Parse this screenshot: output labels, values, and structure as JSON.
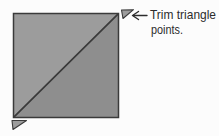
{
  "figure": {
    "kind": "quilt-block-diagram",
    "annotation": {
      "line1": "Trim triangle",
      "line2": "points."
    },
    "icons": {
      "arrow": "left-arrow"
    },
    "shapes": {
      "unit": "half-square-triangle",
      "dog_ears": [
        "top-right",
        "bottom-left"
      ]
    },
    "colors": {
      "background": "#fcfcfc",
      "fabric_light": "#9c9c9c",
      "fabric_dark": "#8e8e8e",
      "outline": "#3a3a3a",
      "text": "#2c2c2c"
    }
  }
}
